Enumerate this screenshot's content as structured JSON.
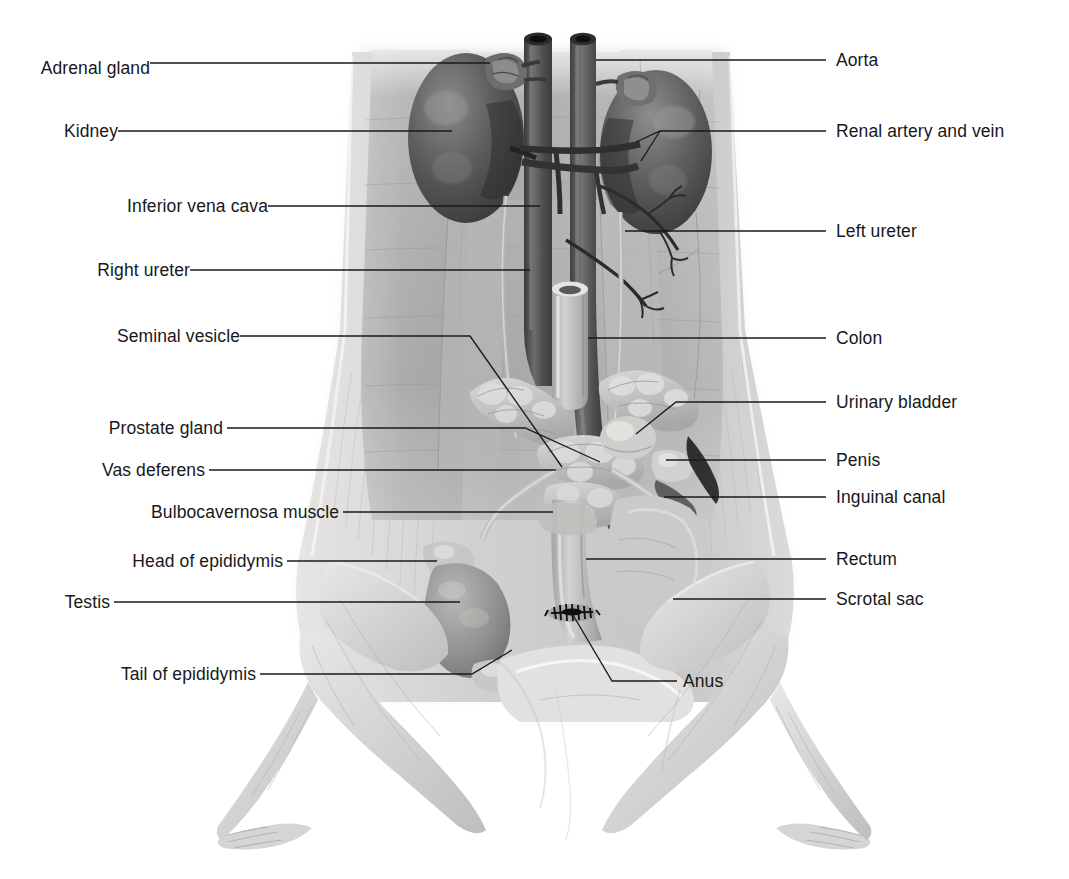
{
  "figure": {
    "style": "grayscale anatomical illustration with leader-line callouts",
    "width": 1069,
    "height": 879,
    "background_color": "#ffffff",
    "text_color": "#17181a",
    "leader_color": "#1a1a1a"
  },
  "labels": {
    "left": [
      {
        "id": "adrenal-gland",
        "text": "Adrenal gland",
        "x": 227,
        "y": 68
      },
      {
        "id": "kidney",
        "text": "Kidney",
        "x": 121,
        "y": 133
      },
      {
        "id": "inferior-vena-cava",
        "text": "Inferior vena cava",
        "x": 263,
        "y": 208
      },
      {
        "id": "right-ureter",
        "text": "Right ureter",
        "x": 186,
        "y": 272
      },
      {
        "id": "seminal-vesicle",
        "text": "Seminal vesicle",
        "x": 236,
        "y": 338
      },
      {
        "id": "prostate-gland",
        "text": "Prostate gland",
        "x": 223,
        "y": 430
      },
      {
        "id": "vas-deferens",
        "text": "Vas deferens",
        "x": 205,
        "y": 472
      },
      {
        "id": "bulbocavernosa-muscle",
        "text": "Bulbocavernosa muscle",
        "x": 339,
        "y": 514
      },
      {
        "id": "head-of-epididymis",
        "text": "Head of epididymis",
        "x": 283,
        "y": 563
      },
      {
        "id": "testis",
        "text": "Testis",
        "x": 110,
        "y": 604
      },
      {
        "id": "tail-of-epididymis",
        "text": "Tail of epididymis",
        "x": 256,
        "y": 676
      }
    ],
    "right": [
      {
        "id": "aorta",
        "text": "Aorta",
        "x": 836,
        "y": 62
      },
      {
        "id": "renal-artery-vein",
        "text": "Renal artery and vein",
        "x": 836,
        "y": 133
      },
      {
        "id": "left-ureter",
        "text": "Left ureter",
        "x": 836,
        "y": 233
      },
      {
        "id": "colon",
        "text": "Colon",
        "x": 836,
        "y": 340
      },
      {
        "id": "urinary-bladder",
        "text": "Urinary bladder",
        "x": 836,
        "y": 404
      },
      {
        "id": "penis",
        "text": "Penis",
        "x": 836,
        "y": 462
      },
      {
        "id": "inguinal-canal",
        "text": "Inguinal canal",
        "x": 836,
        "y": 499
      },
      {
        "id": "rectum",
        "text": "Rectum",
        "x": 836,
        "y": 561
      },
      {
        "id": "scrotal-sac",
        "text": "Scrotal sac",
        "x": 836,
        "y": 601
      }
    ],
    "center": [
      {
        "id": "anus",
        "text": "Anus",
        "x": 683,
        "y": 683
      }
    ]
  },
  "leader_lines": {
    "adrenal_gland": "M150,63 L490,63",
    "kidney": "M118,131 L452,131",
    "inferior_vena_cava": "M268,206 L540,206",
    "right_ureter": "M190,270 L530,270",
    "seminal_vesicle": "M240,336 L470,336 L562,467",
    "prostate_gland": "M227,428 L525,428 L600,462",
    "vas_deferens": "M209,470 L556,470",
    "bulbocavernosa_muscle": "M343,512 L553,512",
    "head_of_epididymis": "M287,561 L437,561",
    "testis": "M114,602 L460,602",
    "tail_of_epididymis": "M260,674 L472,674 L512,650",
    "aorta": "M596,60 L826,60",
    "renal_artery_vein": "M826,131 L660,131 L636,142 M660,131 L641,161",
    "left_ureter": "M826,231 L625,231",
    "colon": "M826,338 L588,338",
    "urinary_bladder": "M826,402 L676,402 L636,434",
    "penis": "M826,460 L666,460",
    "inguinal_canal": "M826,497 L664,497",
    "rectum": "M826,559 L586,559",
    "scrotal_sac": "M826,599 L673,599",
    "anus": "M677,681 L612,681 L573,615"
  },
  "structures": {
    "body": "ventral dissection view of male rat abdomen, pelvis and hind limbs",
    "items": [
      "adrenal gland (left and right, small lobed caps above kidneys)",
      "kidney (paired dark bean-shaped organs)",
      "inferior vena cava (large vertical vessel, cut at top)",
      "aorta (vertical vessel right of vena cava, cut at top)",
      "renal artery and vein (paired horizontal vessels to left kidney)",
      "right ureter and left ureter (thin tubes descending from kidneys)",
      "colon (tubular structure cut transversely mid-abdomen)",
      "seminal vesicle (pale lobed curled glands)",
      "prostate gland (lobed pale tissue below seminal vesicles)",
      "urinary bladder (rounded sac)",
      "vas deferens (slender duct)",
      "bulbocavernosa muscle",
      "penis",
      "inguinal canal",
      "rectum (tube descending to anus)",
      "scrotal sac",
      "testis with head and tail of epididymis (left side, visible externally)",
      "anus (dark puckered opening)",
      "branching mesenteric / lumbar vessels on right side"
    ]
  }
}
